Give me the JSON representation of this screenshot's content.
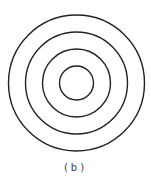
{
  "figure": {
    "type": "concentric-circles",
    "center": {
      "x": 76.5,
      "y": 83
    },
    "circles": [
      {
        "r": 68
      },
      {
        "r": 51
      },
      {
        "r": 34
      },
      {
        "r": 17
      }
    ],
    "stroke_color": "#222222",
    "stroke_width": 1.4
  },
  "caption": "(b)"
}
